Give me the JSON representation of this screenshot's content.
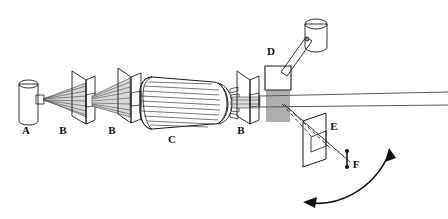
{
  "figure": {
    "type": "apparatus-schematic",
    "background_color": "#ffffff",
    "outline_color": "#1a1a1a",
    "body_fill": "#a8a8a8",
    "body_fill_light": "#c4c4c4",
    "body_fill_dark": "#8f8f8f",
    "label_color": "#111111"
  },
  "labels": {
    "source": "A",
    "collimator_1": "B",
    "collimator_2": "B",
    "selector_drum": "C",
    "collimator_3": "B",
    "grating_housing": "D",
    "detector_plate": "E",
    "detector_point": "F"
  },
  "components": [
    {
      "id": "A",
      "label": "A",
      "name": "source-oven",
      "shape": "cylinder",
      "label_x": 26,
      "label_y": 134
    },
    {
      "id": "B1",
      "label": "B",
      "name": "collimator-slit-first",
      "shape": "slit-plate",
      "label_x": 63,
      "label_y": 134
    },
    {
      "id": "B2",
      "label": "B",
      "name": "collimator-slit-second",
      "shape": "slit-plate",
      "label_x": 112,
      "label_y": 134
    },
    {
      "id": "C",
      "label": "C",
      "name": "rotating-slotted-drum",
      "shape": "helical-slot-cylinder",
      "label_x": 172,
      "label_y": 143
    },
    {
      "id": "B3",
      "label": "B",
      "name": "collimator-slit-third",
      "shape": "slit-plate",
      "label_x": 241,
      "label_y": 134
    },
    {
      "id": "D",
      "label": "D",
      "name": "grating-housing",
      "shape": "box-with-drive-arm",
      "label_x": 271,
      "label_y": 55
    },
    {
      "id": "E",
      "label": "E",
      "name": "detector-plate",
      "shape": "slit-plate",
      "label_x": 334,
      "label_y": 130
    },
    {
      "id": "F",
      "label": "F",
      "name": "detector-point",
      "shape": "point-marker",
      "label_x": 356,
      "label_y": 168
    }
  ],
  "annotations": {
    "swing_arrow": {
      "name": "detector-swing-arrow",
      "style": "double-headed-curved-arrow"
    }
  }
}
